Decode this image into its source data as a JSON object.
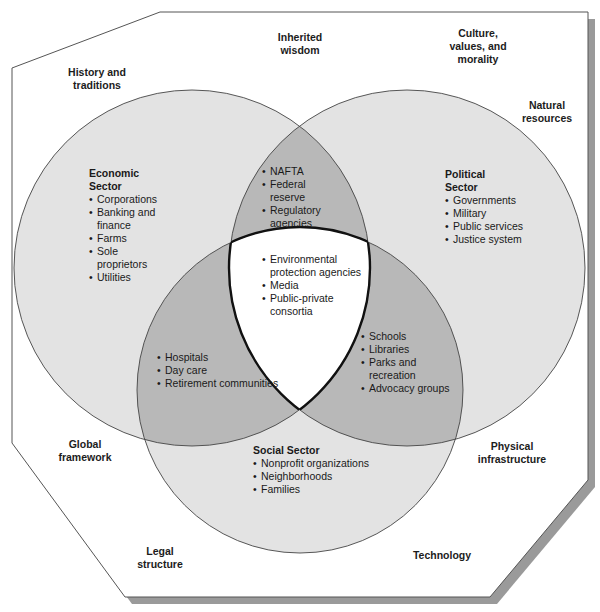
{
  "colors": {
    "background": "#ffffff",
    "frame_fill": "#ffffff",
    "frame_stroke": "#555555",
    "frame_shadow": "#9a9a9a",
    "circle_single": "#e3e3e3",
    "circle_double_overlap": "#b8b8b8",
    "circle_triple_overlap": "#ffffff",
    "circle_stroke": "#444444"
  },
  "context_labels": {
    "history": [
      "History and",
      "traditions"
    ],
    "inherited": [
      "Inherited",
      "wisdom"
    ],
    "culture": [
      "Culture,",
      "values, and",
      "morality"
    ],
    "natural": [
      "Natural",
      "resources"
    ],
    "global": [
      "Global",
      "framework"
    ],
    "physical": [
      "Physical",
      "infrastructure"
    ],
    "legal": [
      "Legal",
      "structure"
    ],
    "technology": [
      "Technology"
    ]
  },
  "sectors": {
    "economic": {
      "title": [
        "Economic",
        "Sector"
      ],
      "items": [
        "Corporations",
        "Banking and finance",
        "Farms",
        "Sole proprietors",
        "Utilities"
      ]
    },
    "political": {
      "title": [
        "Political",
        "Sector"
      ],
      "items": [
        "Governments",
        "Military",
        "Public services",
        "Justice system"
      ]
    },
    "social": {
      "title": [
        "Social Sector"
      ],
      "items": [
        "Nonprofit organizations",
        "Neighborhoods",
        "Families"
      ]
    }
  },
  "overlaps": {
    "economic_political": [
      "NAFTA",
      "Federal reserve",
      "Regulatory agencies"
    ],
    "economic_social": [
      "Hospitals",
      "Day care",
      "Retirement communities"
    ],
    "political_social": [
      "Schools",
      "Libraries",
      "Parks and recreation",
      "Advocacy groups"
    ],
    "all_three": [
      "Environmental protection agencies",
      "Media",
      "Public-private consortia"
    ]
  }
}
